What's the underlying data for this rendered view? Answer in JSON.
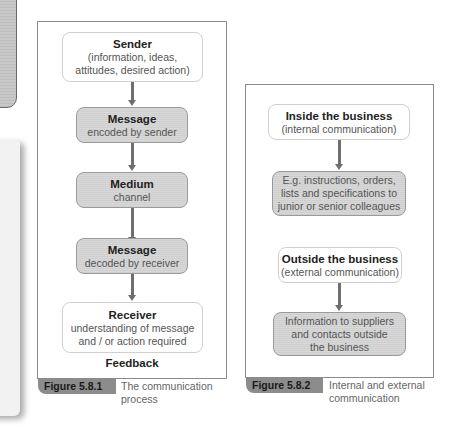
{
  "figure_1": {
    "nodes": [
      {
        "title": "Sender",
        "lines": [
          "(information, ideas,",
          "attitudes, desired action)"
        ],
        "style": "white"
      },
      {
        "title": "Message",
        "lines": [
          "encoded by sender"
        ],
        "style": "grey"
      },
      {
        "title": "Medium",
        "lines": [
          "channel"
        ],
        "style": "grey"
      },
      {
        "title": "Message",
        "lines": [
          "decoded by receiver"
        ],
        "style": "grey"
      },
      {
        "title": "Receiver",
        "lines": [
          "understanding of message",
          "and / or action required"
        ],
        "style": "white"
      }
    ],
    "footer": "Feedback",
    "label": "Figure 5.8.1",
    "caption_lines": [
      "The communication",
      "process"
    ]
  },
  "figure_2": {
    "nodes": [
      {
        "title": "Inside the business",
        "lines": [
          "(internal communication)"
        ],
        "style": "white"
      },
      {
        "title": "",
        "lines": [
          "E.g. instructions, orders,",
          "lists and specifications to",
          "junior or senior colleagues"
        ],
        "style": "grey"
      },
      {
        "title": "Outside the business",
        "lines": [
          "(external communication)"
        ],
        "style": "white"
      },
      {
        "title": "",
        "lines": [
          "Information to suppliers",
          "and contacts outside",
          "the business"
        ],
        "style": "grey"
      }
    ],
    "label": "Figure 5.8.2",
    "caption_lines": [
      "Internal and external",
      "communication"
    ]
  },
  "colors": {
    "frame_border": "#8a8a8a",
    "grey_box": "#d4d4d4",
    "arrow": "#6e6e6e",
    "figure_tab": "#8c8c8c"
  }
}
